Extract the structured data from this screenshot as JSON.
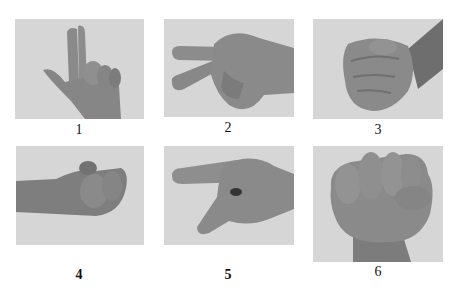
{
  "figure": {
    "panels": [
      {
        "id": 1,
        "label": "1",
        "gesture": "index finger raised, thumb extended",
        "label_bold": false
      },
      {
        "id": 2,
        "label": "2",
        "gesture": "index and middle fingers extended sideways",
        "label_bold": false
      },
      {
        "id": 3,
        "label": "3",
        "gesture": "closed fist side view",
        "label_bold": false
      },
      {
        "id": 4,
        "label": "4",
        "gesture": "fingertips pinched together, forearm horizontal",
        "label_bold": true
      },
      {
        "id": 5,
        "label": "5",
        "gesture": "index finger pointing, thumb extended",
        "label_bold": true
      },
      {
        "id": 6,
        "label": "6",
        "gesture": "closed fist front view",
        "label_bold": false
      }
    ],
    "colors": {
      "photo_bg": "#d6d6d6",
      "skin": "#8a8a8a",
      "skin_dark": "#6e6e6e"
    }
  }
}
